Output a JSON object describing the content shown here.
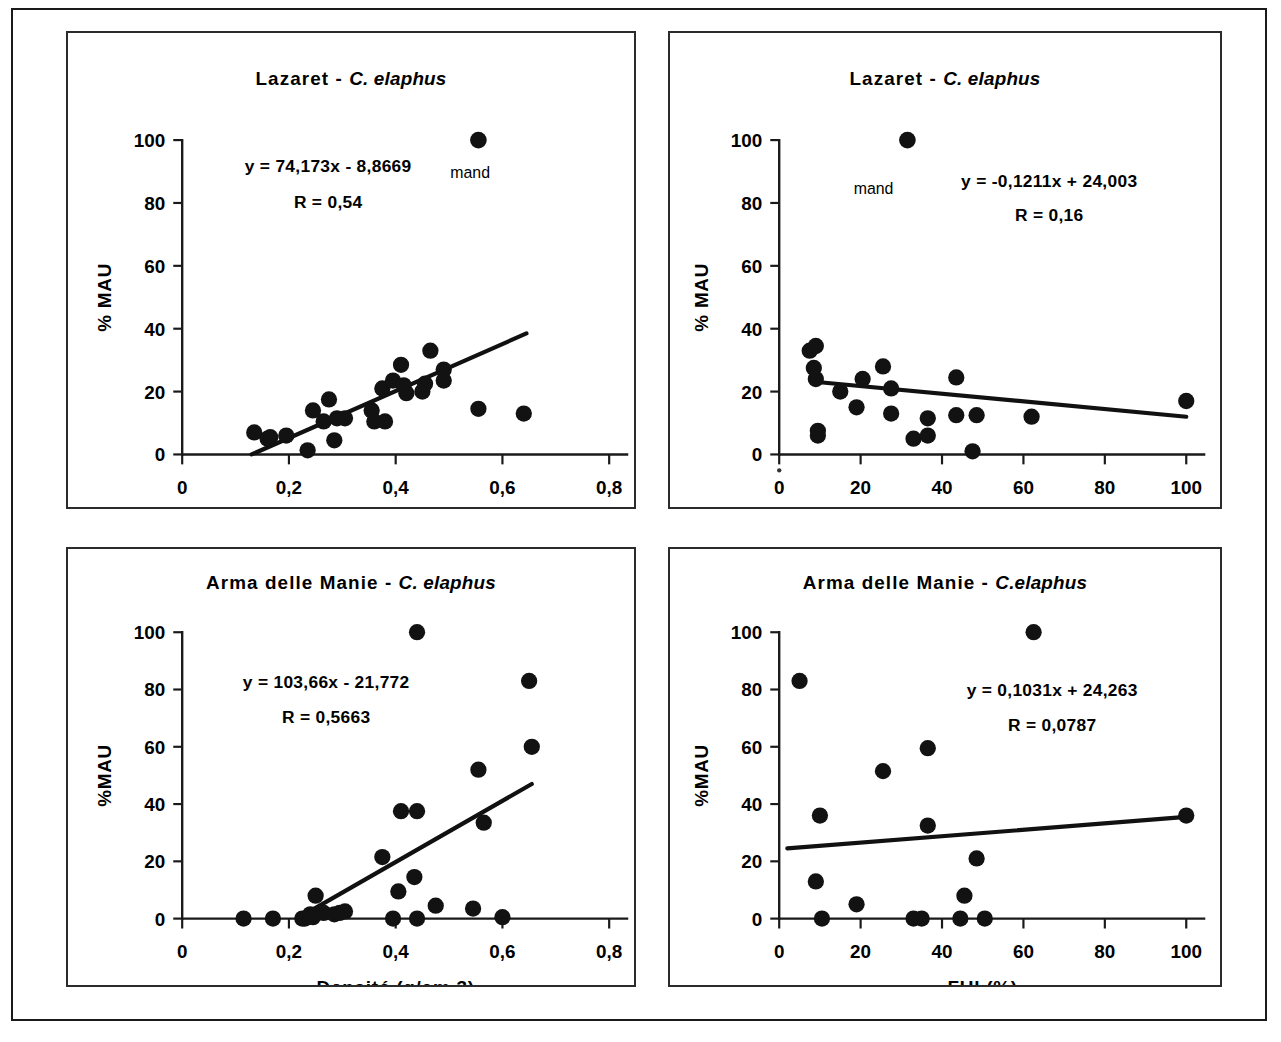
{
  "figure": {
    "panel_count": 4,
    "marker_color": "#121212",
    "line_color": "#111111",
    "axis_color": "#1a1a1a"
  },
  "chart_data": [
    {
      "id": "lazaret-densite",
      "type": "scatter",
      "title_main": "Lazaret - ",
      "title_italic": "C. elaphus",
      "xlabel": "Densité (g/cm ",
      "xlabel_sup": "3",
      "xlabel_end": ")",
      "ylabel": "% MAU",
      "equation": "y = 74,173x - 8,8669",
      "r_value": "R = 0,54",
      "annotation": "mand",
      "xlim": [
        0,
        0.8
      ],
      "ylim": [
        0,
        100
      ],
      "xticks": [
        0,
        0.2,
        0.4,
        0.6,
        0.8
      ],
      "xticklabels": [
        "0",
        "0,2",
        "0,4",
        "0,6",
        "0,8"
      ],
      "yticks": [
        0,
        20,
        40,
        60,
        80,
        100
      ],
      "yticklabels": [
        "0",
        "20",
        "40",
        "60",
        "80",
        "100"
      ],
      "grid": false,
      "trend": {
        "x0": 0.13,
        "y0": 0.0,
        "x1": 0.645,
        "y1": 38.5
      },
      "annotation_point": {
        "x": 0.555,
        "y": 100
      },
      "points": [
        {
          "x": 0.135,
          "y": 7.0
        },
        {
          "x": 0.16,
          "y": 5.0
        },
        {
          "x": 0.165,
          "y": 5.5
        },
        {
          "x": 0.195,
          "y": 6.0
        },
        {
          "x": 0.235,
          "y": 1.3
        },
        {
          "x": 0.245,
          "y": 14.0
        },
        {
          "x": 0.265,
          "y": 10.5
        },
        {
          "x": 0.275,
          "y": 17.5
        },
        {
          "x": 0.285,
          "y": 4.5
        },
        {
          "x": 0.29,
          "y": 11.5
        },
        {
          "x": 0.305,
          "y": 11.5
        },
        {
          "x": 0.355,
          "y": 14.0
        },
        {
          "x": 0.36,
          "y": 10.5
        },
        {
          "x": 0.375,
          "y": 21.0
        },
        {
          "x": 0.38,
          "y": 10.5
        },
        {
          "x": 0.395,
          "y": 23.5
        },
        {
          "x": 0.41,
          "y": 28.5
        },
        {
          "x": 0.415,
          "y": 22.0
        },
        {
          "x": 0.42,
          "y": 19.5
        },
        {
          "x": 0.45,
          "y": 20.0
        },
        {
          "x": 0.455,
          "y": 22.5
        },
        {
          "x": 0.465,
          "y": 33.0
        },
        {
          "x": 0.49,
          "y": 23.5
        },
        {
          "x": 0.49,
          "y": 27.0
        },
        {
          "x": 0.555,
          "y": 14.5
        },
        {
          "x": 0.64,
          "y": 13.0
        }
      ]
    },
    {
      "id": "lazaret-fui",
      "type": "scatter",
      "title_main": "Lazaret - ",
      "title_italic": "C. elaphus",
      "xlabel": "FUI (%)",
      "ylabel": "% MAU",
      "equation": "y = -0,1211x + 24,003",
      "r_value": "R = 0,16",
      "annotation": "mand",
      "xlim": [
        0,
        100
      ],
      "ylim": [
        0,
        100
      ],
      "xticks": [
        0,
        20,
        40,
        60,
        80,
        100
      ],
      "xticklabels": [
        "0",
        "20",
        "40",
        "60",
        "80",
        "100"
      ],
      "yticks": [
        0,
        20,
        40,
        60,
        80,
        100
      ],
      "yticklabels": [
        "0",
        "20",
        "40",
        "60",
        "80",
        "100"
      ],
      "grid": false,
      "trend": {
        "x0": 8.0,
        "y0": 23.2,
        "x1": 100.0,
        "y1": 12.0
      },
      "annotation_point": {
        "x": 31.5,
        "y": 100
      },
      "points": [
        {
          "x": 7.5,
          "y": 33.0
        },
        {
          "x": 9.0,
          "y": 34.5
        },
        {
          "x": 9.0,
          "y": 24.0
        },
        {
          "x": 8.5,
          "y": 27.5
        },
        {
          "x": 9.5,
          "y": 7.5
        },
        {
          "x": 9.5,
          "y": 6.0
        },
        {
          "x": 15.0,
          "y": 20.0
        },
        {
          "x": 19.0,
          "y": 15.0
        },
        {
          "x": 20.5,
          "y": 24.0
        },
        {
          "x": 25.5,
          "y": 28.0
        },
        {
          "x": 27.5,
          "y": 21.0
        },
        {
          "x": 27.5,
          "y": 13.0
        },
        {
          "x": 33.0,
          "y": 5.0
        },
        {
          "x": 36.5,
          "y": 11.5
        },
        {
          "x": 36.5,
          "y": 6.0
        },
        {
          "x": 43.5,
          "y": 24.5
        },
        {
          "x": 43.5,
          "y": 12.5
        },
        {
          "x": 47.5,
          "y": 1.0
        },
        {
          "x": 48.5,
          "y": 12.5
        },
        {
          "x": 62.0,
          "y": 12.0
        },
        {
          "x": 100.0,
          "y": 17.0
        }
      ]
    },
    {
      "id": "arma-densite",
      "type": "scatter",
      "title_main": "Arma delle Manie - ",
      "title_italic": "C. elaphus",
      "xlabel": "Densité (g/cm 3)",
      "ylabel": "%MAU",
      "equation": "y = 103,66x - 21,772",
      "r_value": "R = 0,5663",
      "xlim": [
        0,
        0.8
      ],
      "ylim": [
        0,
        100
      ],
      "xticks": [
        0,
        0.2,
        0.4,
        0.6,
        0.8
      ],
      "xticklabels": [
        "0",
        "0,2",
        "0,4",
        "0,6",
        "0,8"
      ],
      "yticks": [
        0,
        20,
        40,
        60,
        80,
        100
      ],
      "yticklabels": [
        "0",
        "20",
        "40",
        "60",
        "80",
        "100"
      ],
      "grid": false,
      "trend": {
        "x0": 0.215,
        "y0": 0.0,
        "x1": 0.655,
        "y1": 47.0
      },
      "points": [
        {
          "x": 0.115,
          "y": 0.0
        },
        {
          "x": 0.17,
          "y": 0.0
        },
        {
          "x": 0.225,
          "y": 0.0
        },
        {
          "x": 0.23,
          "y": 0.0
        },
        {
          "x": 0.24,
          "y": 1.5
        },
        {
          "x": 0.245,
          "y": 0.5
        },
        {
          "x": 0.25,
          "y": 8.0
        },
        {
          "x": 0.265,
          "y": 2.0
        },
        {
          "x": 0.285,
          "y": 1.5
        },
        {
          "x": 0.295,
          "y": 2.0
        },
        {
          "x": 0.305,
          "y": 2.5
        },
        {
          "x": 0.375,
          "y": 21.5
        },
        {
          "x": 0.395,
          "y": 0.0
        },
        {
          "x": 0.405,
          "y": 9.5
        },
        {
          "x": 0.41,
          "y": 37.5
        },
        {
          "x": 0.44,
          "y": 100.0
        },
        {
          "x": 0.44,
          "y": 37.5
        },
        {
          "x": 0.435,
          "y": 14.5
        },
        {
          "x": 0.44,
          "y": 0.0
        },
        {
          "x": 0.475,
          "y": 4.5
        },
        {
          "x": 0.555,
          "y": 52.0
        },
        {
          "x": 0.545,
          "y": 3.5
        },
        {
          "x": 0.565,
          "y": 33.5
        },
        {
          "x": 0.6,
          "y": 0.5
        },
        {
          "x": 0.65,
          "y": 83.0
        },
        {
          "x": 0.655,
          "y": 60.0
        }
      ]
    },
    {
      "id": "arma-fui",
      "type": "scatter",
      "title_main": "Arma delle Manie - ",
      "title_italic": "C.elaphus",
      "xlabel": "FUI (%)",
      "ylabel": "%MAU",
      "equation": "y = 0,1031x + 24,263",
      "r_value": "R = 0,0787",
      "xlim": [
        0,
        100
      ],
      "ylim": [
        0,
        100
      ],
      "xticks": [
        0,
        20,
        40,
        60,
        80,
        100
      ],
      "xticklabels": [
        "0",
        "20",
        "40",
        "60",
        "80",
        "100"
      ],
      "yticks": [
        0,
        20,
        40,
        60,
        80,
        100
      ],
      "yticklabels": [
        "0",
        "20",
        "40",
        "60",
        "80",
        "100"
      ],
      "grid": false,
      "trend": {
        "x0": 2.0,
        "y0": 24.5,
        "x1": 100.0,
        "y1": 35.5
      },
      "points": [
        {
          "x": 5.0,
          "y": 83.0
        },
        {
          "x": 10.0,
          "y": 36.0
        },
        {
          "x": 9.0,
          "y": 13.0
        },
        {
          "x": 10.5,
          "y": 0.0
        },
        {
          "x": 19.0,
          "y": 5.0
        },
        {
          "x": 25.5,
          "y": 51.5
        },
        {
          "x": 33.0,
          "y": 0.0
        },
        {
          "x": 35.0,
          "y": 0.0
        },
        {
          "x": 36.5,
          "y": 59.5
        },
        {
          "x": 36.5,
          "y": 32.5
        },
        {
          "x": 45.5,
          "y": 8.0
        },
        {
          "x": 44.5,
          "y": 0.0
        },
        {
          "x": 48.5,
          "y": 21.0
        },
        {
          "x": 50.5,
          "y": 0.0
        },
        {
          "x": 62.5,
          "y": 100.0
        },
        {
          "x": 100.0,
          "y": 36.0
        }
      ]
    }
  ]
}
